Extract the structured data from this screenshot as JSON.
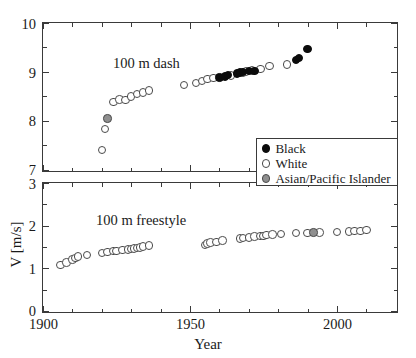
{
  "chart_data": [
    {
      "type": "scatter",
      "panel": "top",
      "title": "100 m dash",
      "xlabel": "",
      "ylabel": "",
      "xlim": [
        1900,
        2020
      ],
      "ylim": [
        7,
        10
      ],
      "xticks": [
        1900,
        1950,
        2000
      ],
      "xtick_labels": [
        "1900",
        "1950",
        "2000"
      ],
      "xticks_minor": [
        1910,
        1920,
        1930,
        1940,
        1960,
        1970,
        1980,
        1990,
        2010
      ],
      "yticks": [
        7,
        8,
        9,
        10
      ],
      "ytick_labels": [
        "7",
        "8",
        "9",
        "10"
      ],
      "yticks_minor": [
        7.5,
        8.5,
        9.5
      ],
      "grid": false,
      "series": [
        {
          "name": "White",
          "category": "white",
          "points": [
            [
              1920,
              7.41
            ],
            [
              1921,
              7.83
            ],
            [
              1924,
              8.38
            ],
            [
              1926,
              8.44
            ],
            [
              1928,
              8.43
            ],
            [
              1930,
              8.5
            ],
            [
              1932,
              8.55
            ],
            [
              1934,
              8.58
            ],
            [
              1936,
              8.62
            ],
            [
              1948,
              8.73
            ],
            [
              1952,
              8.77
            ],
            [
              1954,
              8.81
            ],
            [
              1956,
              8.85
            ],
            [
              1958,
              8.87
            ],
            [
              1964,
              8.93
            ],
            [
              1968,
              8.99
            ],
            [
              1969,
              9.01
            ],
            [
              1971,
              9.03
            ],
            [
              1974,
              9.06
            ],
            [
              1977,
              9.12
            ],
            [
              1983,
              9.15
            ]
          ]
        },
        {
          "name": "Black",
          "category": "black",
          "points": [
            [
              1960,
              8.89
            ],
            [
              1962,
              8.91
            ],
            [
              1963,
              8.94
            ],
            [
              1966,
              8.97
            ],
            [
              1967,
              8.99
            ],
            [
              1968,
              9.0
            ],
            [
              1970,
              9.02
            ],
            [
              1972,
              9.02
            ],
            [
              1986,
              9.24
            ],
            [
              1987,
              9.28
            ],
            [
              1990,
              9.47
            ]
          ]
        },
        {
          "name": "Asian/Pacific Islander",
          "category": "asian",
          "points": [
            [
              1922,
              8.05
            ]
          ]
        }
      ]
    },
    {
      "type": "scatter",
      "panel": "bottom",
      "title": "100 m freestyle",
      "xlabel": "Year",
      "ylabel": "V [m/s]",
      "xlim": [
        1900,
        2020
      ],
      "ylim": [
        0,
        3
      ],
      "xticks": [
        1900,
        1950,
        2000
      ],
      "xtick_labels": [
        "1900",
        "1950",
        "2000"
      ],
      "xticks_minor": [
        1910,
        1920,
        1930,
        1940,
        1960,
        1970,
        1980,
        1990,
        2010
      ],
      "yticks": [
        0,
        1,
        2,
        3
      ],
      "ytick_labels": [
        "0",
        "1",
        "2",
        "3"
      ],
      "yticks_minor": [
        0.5,
        1.5,
        2.5
      ],
      "grid": false,
      "series": [
        {
          "name": "White",
          "category": "white",
          "points": [
            [
              1906,
              1.07
            ],
            [
              1908,
              1.13
            ],
            [
              1910,
              1.2
            ],
            [
              1911,
              1.24
            ],
            [
              1912,
              1.27
            ],
            [
              1915,
              1.31
            ],
            [
              1920,
              1.36
            ],
            [
              1922,
              1.38
            ],
            [
              1924,
              1.4
            ],
            [
              1925,
              1.41
            ],
            [
              1927,
              1.43
            ],
            [
              1929,
              1.44
            ],
            [
              1930,
              1.45
            ],
            [
              1931,
              1.46
            ],
            [
              1932,
              1.47
            ],
            [
              1933,
              1.49
            ],
            [
              1934,
              1.51
            ],
            [
              1936,
              1.53
            ],
            [
              1955,
              1.55
            ],
            [
              1956,
              1.58
            ],
            [
              1957,
              1.6
            ],
            [
              1959,
              1.62
            ],
            [
              1961,
              1.65
            ],
            [
              1967,
              1.7
            ],
            [
              1968,
              1.71
            ],
            [
              1970,
              1.72
            ],
            [
              1972,
              1.74
            ],
            [
              1974,
              1.75
            ],
            [
              1975,
              1.76
            ],
            [
              1976,
              1.78
            ],
            [
              1978,
              1.79
            ],
            [
              1981,
              1.8
            ],
            [
              1986,
              1.82
            ],
            [
              1990,
              1.83
            ],
            [
              1994,
              1.84
            ],
            [
              2000,
              1.85
            ],
            [
              2004,
              1.86
            ],
            [
              2006,
              1.87
            ],
            [
              2008,
              1.88
            ],
            [
              2010,
              1.89
            ]
          ]
        },
        {
          "name": "Asian/Pacific Islander",
          "category": "asian",
          "points": [
            [
              1992,
              1.84
            ]
          ]
        }
      ]
    }
  ],
  "legend": {
    "position": "inside-right-upper-panel",
    "entries": [
      {
        "label": "Black",
        "category": "black"
      },
      {
        "label": "White",
        "category": "white"
      },
      {
        "label": "Asian/Pacific Islander",
        "category": "asian"
      }
    ]
  },
  "axis_titles": {
    "x": "Year",
    "y": "V [m/s]"
  },
  "annotations": {
    "top_panel": "100 m dash",
    "bottom_panel": "100 m freestyle"
  },
  "colors": {
    "black_marker": "#0b0b0b",
    "white_marker": "#ffffff",
    "asian_marker": "#8f8f8f",
    "axis": "#3a3a3a",
    "background": "#ffffff"
  }
}
